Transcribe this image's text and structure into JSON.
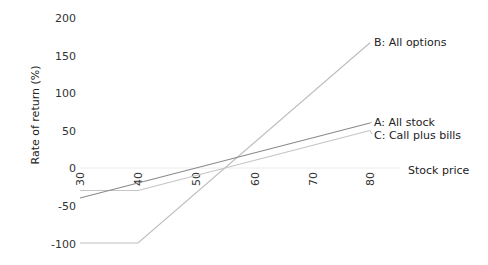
{
  "chart_data": {
    "type": "line",
    "title": "",
    "xlabel": "Stock price",
    "ylabel": "Rate of return (%)",
    "xlim": [
      30,
      80
    ],
    "ylim": [
      -100,
      200
    ],
    "x_ticks": [
      30,
      40,
      50,
      60,
      70,
      80
    ],
    "y_ticks": [
      200,
      150,
      100,
      50,
      0,
      -50,
      -100
    ],
    "grid": false,
    "legend_position": "inline-right",
    "series": [
      {
        "name": "A: All stock",
        "color": "#8a8a8a",
        "points": [
          [
            30,
            -40
          ],
          [
            80,
            60
          ]
        ]
      },
      {
        "name": "B: All options",
        "color": "#bdbdbd",
        "points": [
          [
            30,
            -100
          ],
          [
            40,
            -100
          ],
          [
            80,
            167
          ]
        ]
      },
      {
        "name": "C: Call plus bills",
        "color": "#c4c4c4",
        "points": [
          [
            30,
            -30
          ],
          [
            40,
            -30
          ],
          [
            80,
            50
          ]
        ]
      }
    ]
  },
  "labels": {
    "ylabel": "Rate of return (%)",
    "xlabel": "Stock price",
    "series_a": "A: All stock",
    "series_b": "B: All options",
    "series_c": "C: Call plus bills"
  },
  "ticks": {
    "x": [
      "30",
      "40",
      "50",
      "60",
      "70",
      "80"
    ],
    "y": [
      "200",
      "150",
      "100",
      "50",
      "0",
      "-50",
      "-100"
    ]
  }
}
